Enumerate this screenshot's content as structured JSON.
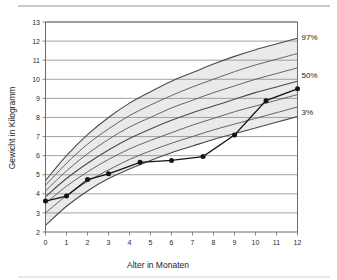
{
  "chart_data": {
    "type": "line",
    "title": "",
    "xlabel": "Alter in Monaten",
    "ylabel": "Gewicht in Kilogramm",
    "xlim": [
      0,
      12
    ],
    "ylim": [
      2,
      13
    ],
    "xticks": [
      0,
      1,
      2,
      3,
      4,
      5,
      6,
      7,
      8,
      9,
      10,
      11,
      12
    ],
    "xtick_labels": [
      "0",
      "1",
      "2",
      "3",
      "4",
      "5",
      "6",
      "7",
      "8",
      "9",
      "10",
      "11",
      "12"
    ],
    "yticks": [
      2,
      3,
      4,
      5,
      6,
      7,
      8,
      9,
      10,
      11,
      12,
      13
    ],
    "ytick_labels": [
      "2",
      "3",
      "4",
      "5",
      "6",
      "7",
      "8",
      "9",
      "10",
      "11",
      "12",
      "13"
    ],
    "grid": "horizontal",
    "legend_position": "right-outside",
    "annotations": [
      {
        "name": "percentile-97-label",
        "text": "97%",
        "x": 12,
        "y": 12.2
      },
      {
        "name": "percentile-50-label",
        "text": "50%",
        "x": 12,
        "y": 10.2
      },
      {
        "name": "percentile-3-label",
        "text": "3%",
        "x": 12,
        "y": 8.3
      }
    ],
    "series": [
      {
        "name": "Messwerte Kind",
        "type": "line-markers",
        "color": "#141414",
        "x": [
          0,
          1,
          2,
          3,
          4.5,
          6,
          7.5,
          9,
          10.5,
          12
        ],
        "values": [
          3.62,
          3.88,
          4.75,
          5.05,
          5.65,
          5.75,
          5.95,
          7.08,
          8.88,
          9.5
        ]
      },
      {
        "name": "97%",
        "type": "percentile-curve",
        "color": "#4a4a4a",
        "x": [
          0,
          1,
          2,
          3,
          4,
          5,
          6,
          7,
          8,
          9,
          10,
          11,
          12
        ],
        "values": [
          4.7,
          6.0,
          7.1,
          8.0,
          8.75,
          9.35,
          9.9,
          10.35,
          10.8,
          11.2,
          11.55,
          11.85,
          12.15
        ]
      },
      {
        "name": "90%",
        "type": "percentile-curve",
        "color": "#555555",
        "x": [
          0,
          1,
          2,
          3,
          4,
          5,
          6,
          7,
          8,
          9,
          10,
          11,
          12
        ],
        "values": [
          4.45,
          5.6,
          6.6,
          7.4,
          8.1,
          8.65,
          9.15,
          9.6,
          10.0,
          10.4,
          10.75,
          11.05,
          11.35
        ]
      },
      {
        "name": "75%",
        "type": "percentile-curve",
        "color": "#555555",
        "x": [
          0,
          1,
          2,
          3,
          4,
          5,
          6,
          7,
          8,
          9,
          10,
          11,
          12
        ],
        "values": [
          4.15,
          5.2,
          6.1,
          6.85,
          7.5,
          8.0,
          8.5,
          8.9,
          9.3,
          9.65,
          10.0,
          10.3,
          10.6
        ]
      },
      {
        "name": "50%",
        "type": "percentile-curve",
        "color": "#4a4a4a",
        "x": [
          0,
          1,
          2,
          3,
          4,
          5,
          6,
          7,
          8,
          9,
          10,
          11,
          12
        ],
        "values": [
          3.85,
          4.8,
          5.6,
          6.3,
          6.9,
          7.4,
          7.85,
          8.25,
          8.6,
          8.95,
          9.3,
          9.6,
          9.9
        ]
      },
      {
        "name": "25%",
        "type": "percentile-curve",
        "color": "#555555",
        "x": [
          0,
          1,
          2,
          3,
          4,
          5,
          6,
          7,
          8,
          9,
          10,
          11,
          12
        ],
        "values": [
          3.5,
          4.4,
          5.15,
          5.8,
          6.35,
          6.8,
          7.2,
          7.6,
          7.95,
          8.3,
          8.6,
          8.9,
          9.2
        ]
      },
      {
        "name": "10%",
        "type": "percentile-curve",
        "color": "#555555",
        "x": [
          0,
          1,
          2,
          3,
          4,
          5,
          6,
          7,
          8,
          9,
          10,
          11,
          12
        ],
        "values": [
          3.0,
          3.9,
          4.65,
          5.25,
          5.8,
          6.25,
          6.65,
          7.0,
          7.35,
          7.65,
          7.95,
          8.25,
          8.55
        ]
      },
      {
        "name": "3%",
        "type": "percentile-curve",
        "color": "#4a4a4a",
        "x": [
          0,
          1,
          2,
          3,
          4,
          5,
          6,
          7,
          8,
          9,
          10,
          11,
          12
        ],
        "values": [
          2.35,
          3.35,
          4.15,
          4.8,
          5.3,
          5.75,
          6.15,
          6.5,
          6.85,
          7.15,
          7.45,
          7.75,
          8.05
        ]
      }
    ]
  }
}
